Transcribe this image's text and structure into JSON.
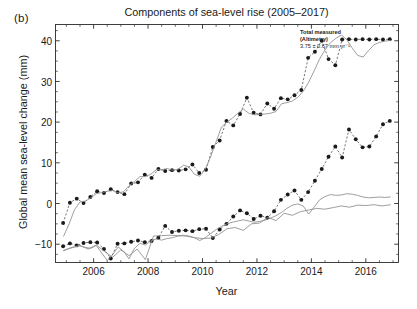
{
  "panel": {
    "label": "(b)"
  },
  "chart_data": {
    "type": "line",
    "title": "Components of sea-level rise (2005–2017)",
    "xlabel": "Year",
    "ylabel": "Global mean sea-level change (mm)",
    "xlim": [
      2004.6,
      2017.2
    ],
    "ylim": [
      -14.5,
      44.0
    ],
    "grid": false,
    "legend_position": "none",
    "xticks": [
      2006,
      2008,
      2010,
      2012,
      2014,
      2016
    ],
    "xtick_labels": [
      "2006",
      "2008",
      "2010",
      "2012",
      "2014",
      "2016"
    ],
    "yticks": [
      -10,
      0,
      10,
      20,
      30,
      40
    ],
    "ytick_labels": [
      "−10",
      "0",
      "10",
      "20",
      "30",
      "40"
    ],
    "yminor_step": 2.5,
    "xminor_step": 0.5,
    "annotations": [
      {
        "name": "total-measured-altimetry",
        "lines": [
          "Total measured",
          "(Altimetry)",
          "3.75 ± 0.67 mm yr⁻¹"
        ],
        "x": 2014.55,
        "y": 41.0
      }
    ],
    "series": [
      {
        "name": "Total measured (Altimetry)",
        "style": "markers-dashed",
        "color": "#1a1a1a",
        "marker": "circle",
        "x": [
          2004.88,
          2005.13,
          2005.38,
          2005.63,
          2005.88,
          2006.13,
          2006.38,
          2006.63,
          2006.88,
          2007.13,
          2007.38,
          2007.63,
          2007.88,
          2008.13,
          2008.38,
          2008.63,
          2008.88,
          2009.13,
          2009.38,
          2009.63,
          2009.88,
          2010.13,
          2010.38,
          2010.63,
          2010.88,
          2011.13,
          2011.38,
          2011.63,
          2011.88,
          2012.13,
          2012.38,
          2012.63,
          2012.88,
          2013.13,
          2013.38,
          2013.63,
          2013.88,
          2014.13,
          2014.38,
          2014.63,
          2014.88,
          2015.13,
          2015.38,
          2015.63,
          2015.88,
          2016.13,
          2016.38,
          2016.63,
          2016.88
        ],
        "y": [
          -4.8,
          0.2,
          1.2,
          0.1,
          1.6,
          3.0,
          2.6,
          3.5,
          2.8,
          2.3,
          4.9,
          5.2,
          7.1,
          6.3,
          8.5,
          8.0,
          8.2,
          8.1,
          8.4,
          9.6,
          7.5,
          8.3,
          13.9,
          15.5,
          20.3,
          19.2,
          22.0,
          26.0,
          22.3,
          21.9,
          24.6,
          23.3,
          25.9,
          25.6,
          26.6,
          27.9,
          35.8,
          37.3,
          40.0,
          35.5,
          34.0,
          40.3,
          40.4,
          40.3,
          40.4,
          40.3,
          40.4,
          40.3,
          40.4
        ]
      },
      {
        "name": "Total measured (Altimetry) smoothed",
        "style": "solid",
        "color": "#8c8c8c",
        "x": [
          2004.9,
          2005.1,
          2005.3,
          2005.5,
          2005.7,
          2005.9,
          2006.1,
          2006.3,
          2006.5,
          2006.7,
          2006.9,
          2007.1,
          2007.3,
          2007.5,
          2007.7,
          2007.9,
          2008.1,
          2008.3,
          2008.5,
          2008.7,
          2008.9,
          2009.1,
          2009.3,
          2009.5,
          2009.7,
          2009.9,
          2010.1,
          2010.3,
          2010.5,
          2010.7,
          2010.9,
          2011.1,
          2011.3,
          2011.5,
          2011.7,
          2011.9,
          2012.1,
          2012.3,
          2012.5,
          2012.7,
          2012.9,
          2013.1,
          2013.3,
          2013.5,
          2013.7,
          2013.9,
          2014.1,
          2014.3,
          2014.5,
          2014.7,
          2014.9,
          2015.1,
          2015.3,
          2015.5,
          2015.7,
          2015.9,
          2016.1,
          2016.3,
          2016.5,
          2016.7,
          2016.9
        ],
        "y": [
          -8.0,
          -5.0,
          -1.5,
          0.4,
          0.6,
          1.4,
          2.4,
          2.7,
          3.0,
          3.2,
          2.6,
          2.9,
          4.4,
          5.4,
          6.6,
          6.6,
          7.2,
          8.3,
          8.3,
          8.6,
          8.2,
          8.4,
          9.4,
          9.0,
          7.2,
          6.7,
          8.4,
          11.5,
          15.2,
          18.8,
          20.0,
          21.0,
          22.2,
          23.2,
          22.2,
          21.8,
          21.9,
          22.0,
          22.2,
          22.6,
          24.5,
          24.8,
          25.2,
          26.1,
          27.6,
          29.8,
          32.6,
          35.5,
          37.8,
          39.5,
          40.6,
          41.4,
          40.3,
          38.2,
          36.4,
          36.0,
          37.6,
          39.0,
          39.6,
          39.9,
          40.1
        ]
      },
      {
        "name": "Ocean mass / steric component",
        "style": "markers-dashed",
        "color": "#1a1a1a",
        "marker": "circle",
        "x": [
          2004.88,
          2005.13,
          2005.38,
          2005.63,
          2005.88,
          2006.13,
          2006.38,
          2006.63,
          2006.88,
          2007.13,
          2007.38,
          2007.63,
          2007.88,
          2008.13,
          2008.38,
          2008.63,
          2008.88,
          2009.13,
          2009.38,
          2009.63,
          2009.88,
          2010.13,
          2010.38,
          2010.63,
          2010.88,
          2011.13,
          2011.38,
          2011.63,
          2011.88,
          2012.13,
          2012.38,
          2012.63,
          2012.88,
          2013.13,
          2013.38,
          2013.63,
          2013.88,
          2014.13,
          2014.38,
          2014.63,
          2014.88,
          2015.13,
          2015.38,
          2015.63,
          2015.88,
          2016.13,
          2016.38,
          2016.63,
          2016.88
        ],
        "y": [
          -10.5,
          -9.8,
          -10.3,
          -9.7,
          -9.5,
          -9.6,
          -11.2,
          -13.5,
          -9.9,
          -9.8,
          -9.4,
          -9.1,
          -9.5,
          -9.2,
          -8.4,
          -5.5,
          -7.0,
          -6.7,
          -6.6,
          -6.8,
          -6.3,
          -6.2,
          -8.5,
          -6.4,
          -5.0,
          -3.2,
          -1.7,
          -2.4,
          -3.8,
          -3.0,
          -3.5,
          -1.9,
          0.9,
          2.2,
          3.2,
          0.9,
          2.8,
          5.6,
          8.5,
          11.5,
          14.0,
          11.3,
          18.2,
          15.8,
          13.8,
          14.0,
          16.5,
          19.5,
          20.3
        ]
      },
      {
        "name": "Ocean mass component (smoothed)",
        "style": "solid",
        "color": "#8c8c8c",
        "x": [
          2004.9,
          2005.1,
          2005.3,
          2005.5,
          2005.7,
          2005.9,
          2006.1,
          2006.3,
          2006.5,
          2006.7,
          2006.9,
          2007.1,
          2007.3,
          2007.5,
          2007.7,
          2007.9,
          2008.1,
          2008.3,
          2008.5,
          2008.7,
          2008.9,
          2009.1,
          2009.3,
          2009.5,
          2009.7,
          2009.9,
          2010.1,
          2010.3,
          2010.5,
          2010.7,
          2010.9,
          2011.1,
          2011.3,
          2011.5,
          2011.7,
          2011.9,
          2012.1,
          2012.3,
          2012.5,
          2012.7,
          2012.9,
          2013.1,
          2013.3,
          2013.5,
          2013.7,
          2013.9,
          2014.1,
          2014.3,
          2014.5,
          2014.7,
          2014.9,
          2015.1,
          2015.3,
          2015.5,
          2015.7,
          2015.9,
          2016.1,
          2016.3,
          2016.5,
          2016.7,
          2016.9
        ],
        "y": [
          -11.6,
          -11.0,
          -10.6,
          -10.4,
          -10.8,
          -11.0,
          -10.3,
          -12.2,
          -14.0,
          -12.6,
          -10.7,
          -11.7,
          -13.6,
          -11.0,
          -9.8,
          -10.2,
          -9.2,
          -8.7,
          -9.0,
          -8.6,
          -8.4,
          -8.0,
          -7.8,
          -8.0,
          -8.4,
          -9.1,
          -8.4,
          -7.4,
          -6.4,
          -5.6,
          -5.0,
          -4.6,
          -4.3,
          -4.0,
          -4.3,
          -4.6,
          -4.4,
          -4.1,
          -3.6,
          -3.0,
          -2.2,
          -1.2,
          -0.4,
          -0.1,
          -0.6,
          -2.6,
          -0.9,
          0.9,
          1.7,
          2.2,
          2.0,
          2.1,
          2.4,
          2.3,
          2.0,
          1.6,
          1.4,
          1.5,
          1.6,
          1.5,
          1.6
        ]
      },
      {
        "name": "Thermosteric component",
        "style": "solid",
        "color": "#8c8c8c",
        "x": [
          2004.9,
          2005.2,
          2005.5,
          2005.8,
          2006.1,
          2006.4,
          2006.7,
          2007.0,
          2007.3,
          2007.6,
          2007.9,
          2008.2,
          2008.5,
          2008.8,
          2009.1,
          2009.4,
          2009.7,
          2010.0,
          2010.3,
          2010.6,
          2010.9,
          2011.2,
          2011.5,
          2011.8,
          2012.1,
          2012.4,
          2012.7,
          2013.0,
          2013.3,
          2013.6,
          2013.9,
          2014.2,
          2014.5,
          2014.8,
          2015.1,
          2015.4,
          2015.7,
          2016.0,
          2016.3,
          2016.6,
          2016.9
        ],
        "y": [
          -11.5,
          -10.9,
          -10.3,
          -11.2,
          -10.2,
          -11.8,
          -13.2,
          -11.4,
          -12.8,
          -11.2,
          -13.8,
          -8.0,
          -7.9,
          -7.8,
          -7.9,
          -8.0,
          -8.4,
          -8.6,
          -8.5,
          -7.6,
          -6.2,
          -5.9,
          -6.6,
          -5.0,
          -4.8,
          -3.4,
          -4.2,
          -2.4,
          -2.9,
          -2.0,
          -1.6,
          -1.2,
          -1.4,
          -1.0,
          -0.6,
          -0.9,
          -0.4,
          -0.5,
          -0.3,
          -0.6,
          -0.3
        ]
      }
    ]
  }
}
